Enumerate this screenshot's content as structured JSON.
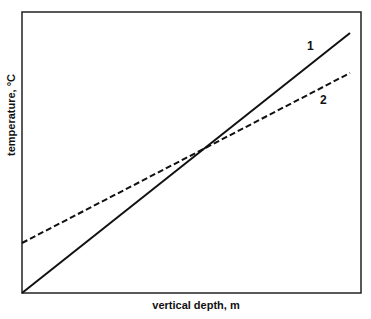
{
  "chart_data": {
    "type": "line",
    "title": "",
    "xlabel": "vertical depth, m",
    "ylabel": "temperature, °C",
    "grid": false,
    "legend": "inline labels at line ends",
    "xlim": [
      0,
      1
    ],
    "ylim": [
      0,
      1
    ],
    "series": [
      {
        "name": "1",
        "style": "solid",
        "x": [
          0,
          0.97
        ],
        "y": [
          0,
          0.93
        ]
      },
      {
        "name": "2",
        "style": "dashed",
        "x": [
          0,
          0.97
        ],
        "y": [
          0.18,
          0.78
        ]
      }
    ],
    "annotations": [
      {
        "text": "1",
        "near": "end of solid line"
      },
      {
        "text": "2",
        "near": "end of dashed line"
      }
    ]
  },
  "frame": {
    "left": 22,
    "top": 12,
    "right": 361,
    "bottom": 293
  },
  "lines": {
    "line1": {
      "x1": 22,
      "y1": 293,
      "x2": 350,
      "y2": 33,
      "label": "1",
      "label_x": 310,
      "label_y": 50
    },
    "line2": {
      "x1": 22,
      "y1": 243,
      "x2": 350,
      "y2": 73,
      "label": "2",
      "label_x": 320,
      "label_y": 104
    }
  },
  "axes": {
    "xlabel": "vertical depth, m",
    "ylabel": "temperature, °C"
  }
}
